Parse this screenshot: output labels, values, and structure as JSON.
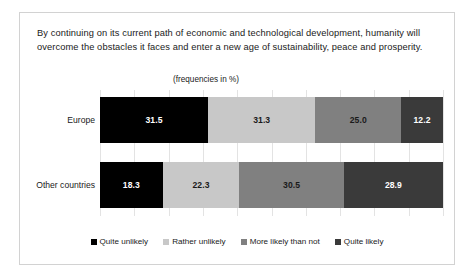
{
  "figure": {
    "question": "By continuing on its current path of economic and technological development, humanity will overcome the obstacles it faces and enter a new age of sustainability, peace and prosperity.",
    "units_note": "(frequencies in %)"
  },
  "chart_data": {
    "type": "bar",
    "orientation": "horizontal",
    "stacked": true,
    "stack_total": 100,
    "title": "By continuing on its current path of economic and technological development, humanity will overcome the obstacles it faces and enter a new age of sustainability, peace and prosperity.",
    "subtitle": "(frequencies in %)",
    "xlabel": "",
    "ylabel": "",
    "xlim": [
      0,
      100
    ],
    "grid": true,
    "grid_axis": "x",
    "legend_position": "bottom",
    "categories": [
      "Europe",
      "Other countries"
    ],
    "series": [
      {
        "name": "Quite unlikely",
        "color": "#000000",
        "values": [
          31.5,
          18.3
        ],
        "labels": [
          "31.5",
          "18.3"
        ],
        "label_color": "#ffffff"
      },
      {
        "name": "Rather unlikely",
        "color": "#c8c8c8",
        "values": [
          31.3,
          22.3
        ],
        "labels": [
          "31.3",
          "22.3"
        ],
        "label_color": "#1a1a1a"
      },
      {
        "name": "More likely than not",
        "color": "#808080",
        "values": [
          25.0,
          30.5
        ],
        "labels": [
          "25.0",
          "30.5"
        ],
        "label_color": "#1a1a1a"
      },
      {
        "name": "Quite likely",
        "color": "#3a3a3a",
        "values": [
          12.2,
          28.9
        ],
        "labels": [
          "12.2",
          "28.9"
        ],
        "label_color": "#ffffff"
      }
    ]
  }
}
